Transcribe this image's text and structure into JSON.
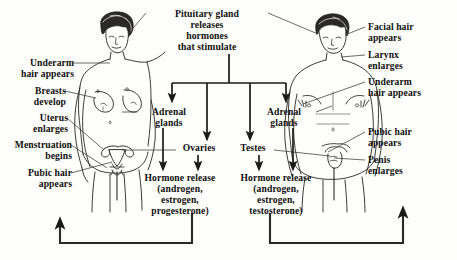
{
  "diagram": {
    "title_block": "Pituitary gland\nreleases\nhormones\nthat stimulate",
    "female_labels": [
      "Underarm\nhair appears",
      "Breasts\ndevelop",
      "Uterus\nenlarges",
      "Menstruation\nbegins",
      "Pubic hair\nappears"
    ],
    "male_labels": [
      "Facial hair\nappears",
      "Larynx\nenlarges",
      "Underarm\nhair appears",
      "Pubic hair\nappears",
      "Penis\nenlarges"
    ],
    "center_nodes": {
      "adrenal_left": "Adrenal\nglands",
      "adrenal_right": "Adrenal\nglands",
      "ovaries": "Ovaries",
      "testes": "Testes",
      "hormone_left": "Hormone release\n(androgen,\nestrogen,\nprogesterone)",
      "hormone_right": "Hormone release\n(androgen,\nestrogen,\ntestosterone)"
    },
    "colors": {
      "ink": "#100f0d",
      "background": "#fdfdfb",
      "arrow": "#1b1a18",
      "leader": "#3a3935"
    }
  }
}
